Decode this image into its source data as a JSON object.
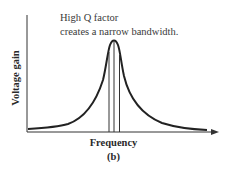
{
  "annotation": {
    "line1": "High Q factor",
    "line2": "creates a narrow bandwidth."
  },
  "axes": {
    "ylabel": "Voltage gain",
    "xlabel": "Frequency"
  },
  "caption": "(b)",
  "diagram": {
    "type": "resonance-curve",
    "stroke_color": "#222222"
  }
}
